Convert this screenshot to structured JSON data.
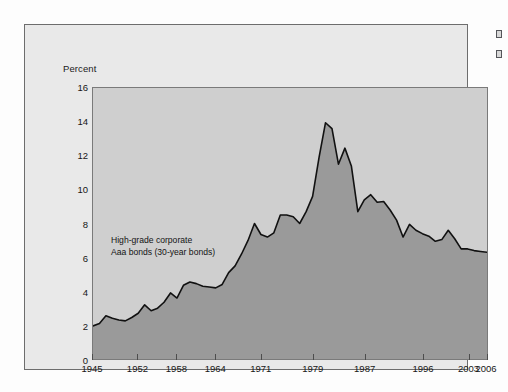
{
  "figure": {
    "background_color": "#e9e9e9",
    "plot_background_color": "#cfcfcf",
    "area_fill_color": "#9a9a9a",
    "line_color": "#111111",
    "frame_color": "#6d6d6d"
  },
  "edge_marks": [
    {
      "name": "cut-off-mark-top"
    },
    {
      "name": "cut-off-mark-bottom"
    }
  ],
  "annotation": {
    "line1": "High-grade corporate",
    "line2": "Aaa bonds (30-year bonds)"
  },
  "chart_data": {
    "type": "area",
    "title": "",
    "subtitle": "",
    "xlabel": "",
    "ylabel": "Percent",
    "ylim": [
      0,
      16
    ],
    "xlim": [
      1945,
      2006
    ],
    "grid": false,
    "legend_position": "inside-left",
    "y_ticks": [
      0,
      2,
      4,
      6,
      8,
      10,
      12,
      14,
      16
    ],
    "y_tick_labels": [
      "0",
      "2",
      "4",
      "6",
      "8",
      "10",
      "12",
      "14",
      "16"
    ],
    "x_ticks": [
      1945,
      1952,
      1958,
      1964,
      1971,
      1979,
      1987,
      1996,
      2003,
      2006
    ],
    "x_tick_labels": [
      "1945",
      "1952",
      "1958",
      "1964",
      "1971",
      "1979",
      "1987",
      "1996",
      "2003",
      "2006"
    ],
    "annotations": [
      {
        "text": "High-grade corporate Aaa bonds (30-year bonds)",
        "x": 1953,
        "y": 6.6
      }
    ],
    "series": [
      {
        "name": "High-grade corporate Aaa bonds (30-year bonds)",
        "x": [
          1945,
          1946,
          1947,
          1948,
          1949,
          1950,
          1951,
          1952,
          1953,
          1954,
          1955,
          1956,
          1957,
          1958,
          1959,
          1960,
          1961,
          1962,
          1963,
          1964,
          1965,
          1966,
          1967,
          1968,
          1969,
          1970,
          1971,
          1972,
          1973,
          1974,
          1975,
          1976,
          1977,
          1978,
          1979,
          1980,
          1981,
          1982,
          1983,
          1984,
          1985,
          1986,
          1987,
          1988,
          1989,
          1990,
          1991,
          1992,
          1993,
          1994,
          1995,
          1996,
          1997,
          1998,
          1999,
          2000,
          2001,
          2002,
          2003,
          2004,
          2005,
          2006
        ],
        "values": [
          1.95,
          2.1,
          2.55,
          2.4,
          2.3,
          2.25,
          2.45,
          2.7,
          3.2,
          2.85,
          3.0,
          3.35,
          3.9,
          3.6,
          4.35,
          4.55,
          4.45,
          4.3,
          4.25,
          4.2,
          4.4,
          5.1,
          5.5,
          6.2,
          7.0,
          8.0,
          7.35,
          7.2,
          7.45,
          8.5,
          8.5,
          8.4,
          8.0,
          8.7,
          9.6,
          11.9,
          13.95,
          13.6,
          11.5,
          12.45,
          11.4,
          8.7,
          9.4,
          9.7,
          9.25,
          9.3,
          8.8,
          8.2,
          7.2,
          7.95,
          7.6,
          7.4,
          7.25,
          6.95,
          7.05,
          7.6,
          7.1,
          6.5,
          6.5,
          6.4,
          6.35,
          6.3
        ],
        "fill": true,
        "fill_color": "#9a9a9a",
        "line_color": "#111111",
        "line_width": 1.6
      }
    ]
  }
}
